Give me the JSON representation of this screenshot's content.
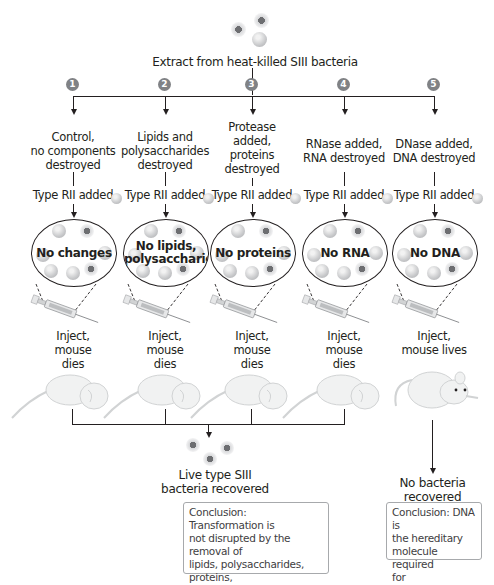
{
  "title": "Extract from heat-killed SIII bacteria",
  "experiments": [
    {
      "number": "1",
      "treatment": [
        "Control,",
        "no components",
        "destroyed"
      ],
      "added": "Type RII added",
      "result_label": [
        "No changes"
      ],
      "outcome": [
        "Inject,",
        "mouse",
        "dies"
      ],
      "mouse_state": "dead"
    },
    {
      "number": "2",
      "treatment": [
        "Lipids and",
        "polysaccharides",
        "destroyed"
      ],
      "added": "Type RII added",
      "result_label": [
        "No lipids,",
        "polysaccharides"
      ],
      "outcome": [
        "Inject,",
        "mouse",
        "dies"
      ],
      "mouse_state": "dead"
    },
    {
      "number": "3",
      "treatment": [
        "Protease",
        "added,",
        "proteins",
        "destroyed"
      ],
      "added": "Type RII added",
      "result_label": [
        "No proteins"
      ],
      "outcome": [
        "Inject,",
        "mouse",
        "dies"
      ],
      "mouse_state": "dead"
    },
    {
      "number": "4",
      "treatment": [
        "RNase added,",
        "RNA destroyed"
      ],
      "added": "Type RII added",
      "result_label": [
        "No RNA"
      ],
      "outcome": [
        "Inject,",
        "mouse",
        "dies"
      ],
      "mouse_state": "dead"
    },
    {
      "number": "5",
      "treatment": [
        "DNase added,",
        "DNA destroyed"
      ],
      "added": "Type RII added",
      "result_label": [
        "No DNA"
      ],
      "outcome": [
        "Inject,",
        "mouse lives"
      ],
      "mouse_state": "alive"
    }
  ],
  "results": {
    "left": {
      "label": [
        "Live type SIII",
        "bacteria recovered"
      ],
      "conclusion": [
        "Conclusion: Transformation is",
        "not disrupted by the removal of",
        "lipids, polysaccharides, proteins,",
        "or RNA; therefore, none of these",
        "is the transformation factor."
      ]
    },
    "right": {
      "label": [
        "No bacteria",
        "recovered"
      ],
      "conclusion": [
        "Conclusion: DNA is",
        "the hereditary",
        "molecule required",
        "for transformation."
      ]
    }
  },
  "colors": {
    "number_badge": "#808285",
    "line": "#231f20",
    "conclusion_border": "#a7a9ac"
  }
}
